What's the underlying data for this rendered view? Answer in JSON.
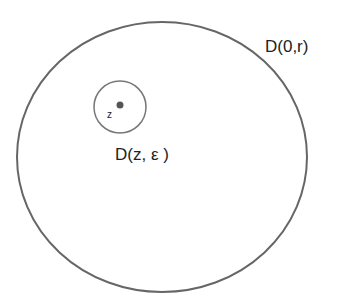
{
  "diagram": {
    "outer_disk": {
      "label": "D(0,r)",
      "stroke": "#666666"
    },
    "inner_disk": {
      "label": "D(z, ε )",
      "stroke": "#777777"
    },
    "point": {
      "label": "z",
      "fill": "#555555"
    }
  }
}
